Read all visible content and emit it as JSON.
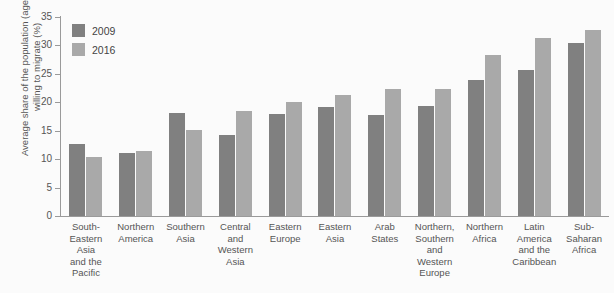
{
  "chart_data": {
    "type": "bar",
    "title": "",
    "xlabel": "",
    "ylabel": "Average share of the population (age 15+)\nwilling to migrate (%)",
    "ylim": [
      0,
      35
    ],
    "yticks": [
      0,
      5,
      10,
      15,
      20,
      25,
      30,
      35
    ],
    "grid": false,
    "legend_position": "top-left",
    "categories": [
      "South-\nEastern\nAsia\nand the\nPacific",
      "Northern\nAmerica",
      "Southern\nAsia",
      "Central\nand\nWestern\nAsia",
      "Eastern\nEurope",
      "Eastern\nAsia",
      "Arab\nStates",
      "Northern,\nSouthern\nand\nWestern\nEurope",
      "Northern\nAfrica",
      "Latin\nAmerica\nand the\nCaribbean",
      "Sub-\nSaharan\nAfrica"
    ],
    "series": [
      {
        "name": "2009",
        "color": "#808080",
        "values": [
          12.7,
          11.1,
          18.1,
          14.3,
          18.0,
          19.2,
          17.7,
          19.3,
          24.0,
          25.6,
          30.4
        ]
      },
      {
        "name": "2016",
        "color": "#a9a9a9",
        "values": [
          10.3,
          11.4,
          15.1,
          18.5,
          20.1,
          21.2,
          22.3,
          22.4,
          28.3,
          31.3,
          32.7
        ]
      }
    ]
  },
  "legend": {
    "items": [
      {
        "label": "2009",
        "color": "#808080"
      },
      {
        "label": "2016",
        "color": "#a9a9a9"
      }
    ]
  }
}
